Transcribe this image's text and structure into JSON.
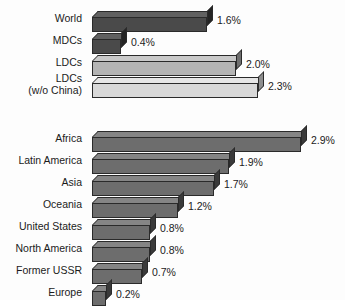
{
  "chart_data": {
    "type": "bar",
    "orientation": "horizontal",
    "title": "",
    "xlabel": "",
    "ylabel": "",
    "value_suffix": "%",
    "xlim": [
      0,
      3.0
    ],
    "grid": false,
    "legend": "none",
    "groups": [
      {
        "name": "global-aggregates",
        "categories": [
          "World",
          "MDCs",
          "LDCs",
          "LDCs\n(w/o China)"
        ],
        "values": [
          1.6,
          2.0,
          2.3,
          0.4
        ],
        "bars": [
          {
            "label": "World",
            "value": 1.6,
            "value_label": "1.6%",
            "tone": "tone-dark",
            "lines": 1
          },
          {
            "label": "MDCs",
            "value": 0.4,
            "value_label": "0.4%",
            "tone": "tone-dark",
            "lines": 1
          },
          {
            "label": "LDCs",
            "value": 2.0,
            "value_label": "2.0%",
            "tone": "tone-light",
            "lines": 1
          },
          {
            "label": "LDCs\n(w/o China)",
            "value": 2.3,
            "value_label": "2.3%",
            "tone": "tone-lightest",
            "lines": 2
          }
        ]
      },
      {
        "name": "regions",
        "categories": [
          "Africa",
          "Latin America",
          "Asia",
          "Oceania",
          "United States",
          "North America",
          "Former USSR",
          "Europe"
        ],
        "values": [
          2.9,
          1.9,
          1.7,
          1.2,
          0.8,
          0.8,
          0.7,
          0.2
        ],
        "bars": [
          {
            "label": "Africa",
            "value": 2.9,
            "value_label": "2.9%",
            "tone": "tone-mid",
            "lines": 1
          },
          {
            "label": "Latin America",
            "value": 1.9,
            "value_label": "1.9%",
            "tone": "tone-mid",
            "lines": 1
          },
          {
            "label": "Asia",
            "value": 1.7,
            "value_label": "1.7%",
            "tone": "tone-mid",
            "lines": 1
          },
          {
            "label": "Oceania",
            "value": 1.2,
            "value_label": "1.2%",
            "tone": "tone-mid",
            "lines": 1
          },
          {
            "label": "United States",
            "value": 0.8,
            "value_label": "0.8%",
            "tone": "tone-mid",
            "lines": 1
          },
          {
            "label": "North America",
            "value": 0.8,
            "value_label": "0.8%",
            "tone": "tone-mid",
            "lines": 1
          },
          {
            "label": "Former USSR",
            "value": 0.7,
            "value_label": "0.7%",
            "tone": "tone-mid",
            "lines": 1
          },
          {
            "label": "Europe",
            "value": 0.2,
            "value_label": "0.2%",
            "tone": "tone-mid",
            "lines": 1
          }
        ]
      }
    ],
    "colors": {
      "background": "#fdfdfd",
      "text": "#1b1b1b",
      "bar_dark": "#4a4a4a",
      "bar_mid": "#6d6d6d",
      "bar_light": "#b4b4b4",
      "bar_lightest": "#d8d8d8",
      "bar_outline": "#2a2a2a"
    },
    "layout": {
      "bar_origin_x": 92,
      "px_per_unit": 72,
      "row_height": 22,
      "group_top_y": 8,
      "group_bottom_y": 134,
      "depth_px": 6
    }
  }
}
